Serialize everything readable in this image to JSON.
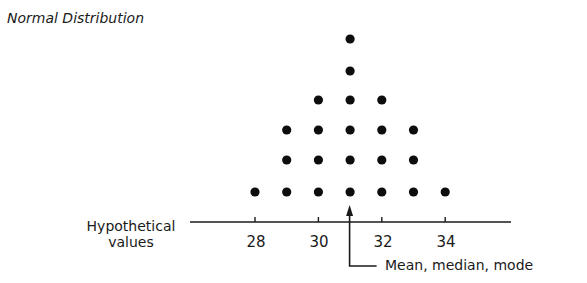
{
  "chart_data": {
    "type": "scatter",
    "subtype": "dot-plot",
    "title": "Normal Distribution",
    "xlabel": "Hypothetical values",
    "ylabel": "",
    "x_ticks": [
      28,
      30,
      32,
      34
    ],
    "x": [
      28,
      29,
      30,
      31,
      32,
      33,
      34
    ],
    "counts": [
      1,
      3,
      4,
      6,
      4,
      3,
      1
    ],
    "xlim": [
      26,
      36
    ],
    "grid": false,
    "legend": "none",
    "annotations": [
      {
        "text": "Mean, median, mode",
        "x": 31,
        "type": "arrow"
      }
    ]
  },
  "title": "Normal Distribution",
  "axis_label_line1": "Hypothetical",
  "axis_label_line2": "values",
  "ticks": [
    "28",
    "30",
    "32",
    "34"
  ],
  "annotation": "Mean, median, mode",
  "colors": {
    "dot": "#0d0d0d",
    "axis": "#1a1a1a",
    "background": "#ffffff"
  }
}
